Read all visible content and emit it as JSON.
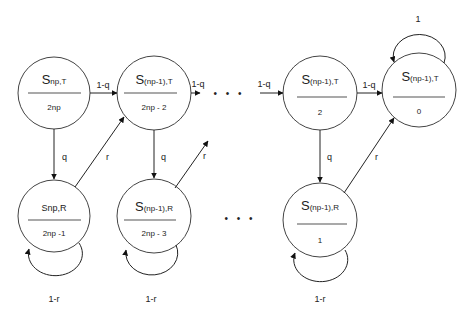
{
  "diagram": {
    "type": "markov-chain",
    "nodes": [
      {
        "id": "A",
        "state": "S",
        "sub": "np,T",
        "value": "2np",
        "cx": 54,
        "cy": 93
      },
      {
        "id": "B",
        "state": "S",
        "sub": "(np-1),T",
        "value": "2np - 2",
        "cx": 154,
        "cy": 93
      },
      {
        "id": "C",
        "state": "S",
        "sub": "(np-1),T",
        "value": "2",
        "cx": 320,
        "cy": 93
      },
      {
        "id": "D",
        "state": "S",
        "sub": "(np-1),T",
        "value": "0",
        "cx": 419,
        "cy": 90
      },
      {
        "id": "E",
        "state": "S",
        "sub": "np,R",
        "value": "2np -1",
        "cx": 54,
        "cy": 216
      },
      {
        "id": "F",
        "state": "S",
        "sub": "(np-1),R",
        "value": "2np - 3",
        "cx": 154,
        "cy": 216
      },
      {
        "id": "G",
        "state": "S",
        "sub": "(np-1),R",
        "value": "1",
        "cx": 320,
        "cy": 216
      }
    ],
    "edges": [
      {
        "from": "A",
        "to": "B",
        "label": "1-q"
      },
      {
        "from": "B",
        "to": "ellipsis-top",
        "label": "1-q"
      },
      {
        "from": "ellipsis-top",
        "to": "C",
        "label": "1-q"
      },
      {
        "from": "C",
        "to": "D",
        "label": "1-q"
      },
      {
        "from": "A",
        "to": "E",
        "label": "q"
      },
      {
        "from": "B",
        "to": "F",
        "label": "q"
      },
      {
        "from": "C",
        "to": "G",
        "label": "q"
      },
      {
        "from": "E",
        "to": "B",
        "label": "r"
      },
      {
        "from": "F",
        "to": "ellipsis-top",
        "label": "r"
      },
      {
        "from": "G",
        "to": "D",
        "label": "r"
      },
      {
        "from": "E",
        "to": "E",
        "label": "1-r"
      },
      {
        "from": "F",
        "to": "F",
        "label": "1-r"
      },
      {
        "from": "G",
        "to": "G",
        "label": "1-r"
      },
      {
        "from": "D",
        "to": "D",
        "label": "1"
      }
    ],
    "labels": {
      "A_state": "S",
      "A_sub": "np,T",
      "A_value": "2np",
      "B_state": "S",
      "B_sub": "(np-1),T",
      "B_value": "2np - 2",
      "C_state": "S",
      "C_sub": "(np-1),T",
      "C_value": "2",
      "D_state": "S",
      "D_sub": "(np-1),T",
      "D_value": "0",
      "E_state": "S",
      "E_sub": "np,R",
      "E_value": "2np -1",
      "F_state": "S",
      "F_sub": "(np-1),R",
      "F_value": "2np - 3",
      "G_state": "S",
      "G_sub": "(np-1),R",
      "G_value": "1",
      "edge_AB": "1-q",
      "edge_B_dots": "1-q",
      "edge_dots_C": "1-q",
      "edge_CD": "1-q",
      "edge_AE": "q",
      "edge_BF": "q",
      "edge_CG": "q",
      "edge_EB": "r",
      "edge_F_up": "r",
      "edge_GD": "r",
      "loop_E": "1-r",
      "loop_F": "1-r",
      "loop_G": "1-r",
      "loop_D": "1",
      "ellipsis_top": "• • •",
      "ellipsis_bottom": "• • •"
    }
  }
}
